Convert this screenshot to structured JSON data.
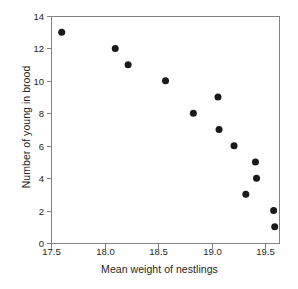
{
  "chart_data": {
    "type": "scatter",
    "title": "",
    "xlabel": "Mean weight of nestlings",
    "ylabel": "Number of young in brood",
    "xlim": [
      17.5,
      19.63
    ],
    "ylim": [
      0,
      14
    ],
    "xticks": [
      17.5,
      18.0,
      18.5,
      19.0,
      19.5
    ],
    "xtick_labels": [
      "17.5",
      "18.0",
      "18.5",
      "19.0",
      "19.5"
    ],
    "yticks": [
      0,
      2,
      4,
      6,
      8,
      10,
      12,
      14
    ],
    "ytick_labels": [
      "0",
      "2",
      "4",
      "6",
      "8",
      "10",
      "12",
      "14"
    ],
    "grid": false,
    "legend": null,
    "marker": "filled-circle",
    "marker_color": "#1a1a1a",
    "marker_size": 7,
    "x": [
      17.6,
      18.1,
      18.22,
      18.57,
      18.83,
      19.06,
      19.07,
      19.21,
      19.32,
      19.41,
      19.42,
      19.58,
      19.59
    ],
    "y": [
      13,
      12,
      11,
      10,
      8,
      9,
      7,
      6,
      3,
      5,
      4,
      2,
      1
    ],
    "points": [
      {
        "x": 17.6,
        "y": 13
      },
      {
        "x": 18.1,
        "y": 12
      },
      {
        "x": 18.22,
        "y": 11
      },
      {
        "x": 18.57,
        "y": 10
      },
      {
        "x": 18.83,
        "y": 8
      },
      {
        "x": 19.06,
        "y": 9
      },
      {
        "x": 19.07,
        "y": 7
      },
      {
        "x": 19.21,
        "y": 6
      },
      {
        "x": 19.32,
        "y": 3
      },
      {
        "x": 19.41,
        "y": 5
      },
      {
        "x": 19.42,
        "y": 4
      },
      {
        "x": 19.58,
        "y": 2
      },
      {
        "x": 19.59,
        "y": 1
      }
    ]
  },
  "axes": {
    "x_title": "Mean weight of nestlings",
    "y_title": "Number of young in brood",
    "frame_color": "#808285",
    "tick_color": "#808285"
  }
}
